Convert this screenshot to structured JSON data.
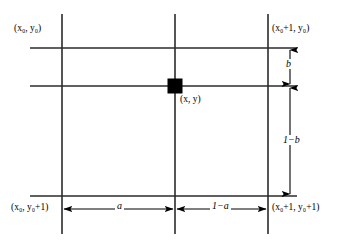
{
  "figure": {
    "name": "bilinear-interpolation-cell",
    "background_color": "#ffffff",
    "line_color": "#000000"
  },
  "labels": {
    "corner_top_left": "(x₀, y₀)",
    "corner_top_right": "(x₀+1, y₀)",
    "corner_bottom_left": "(x₀, y₀+1)",
    "corner_bottom_right": "(x₀+1, y₀+1)",
    "sample_point": "(x, y)",
    "dim_vertical_top": "b",
    "dim_vertical_bottom": "1−b",
    "dim_horizontal_left": "a",
    "dim_horizontal_right": "1−a"
  },
  "geometry": {
    "grid_left_x": 62,
    "grid_center_x": 175,
    "grid_right_x": 268,
    "grid_top_y": 48,
    "grid_middle_y": 86,
    "grid_bottom_y": 196,
    "vertical_extent_top": 14,
    "vertical_extent_bottom": 234,
    "horizontal_extent_left": 30,
    "horizontal_extent_right": 297,
    "marker_size": 15,
    "dim_column_x": 290,
    "dim_row_y": 209
  }
}
